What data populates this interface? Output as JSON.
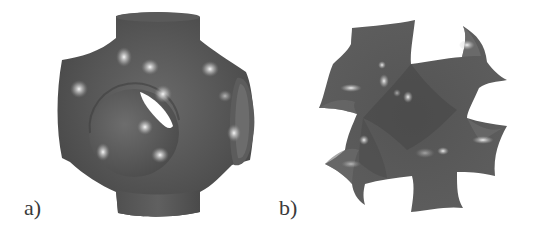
{
  "figure": {
    "panels": [
      {
        "id": "a",
        "label": "a)",
        "subject": "schwarz-p-surface"
      },
      {
        "id": "b",
        "label": "b)",
        "subject": "gyroid-surface"
      }
    ],
    "colors": {
      "background": "#ffffff",
      "surface_dark": "#4a4a4a",
      "surface_mid": "#5e5e5e",
      "highlight": "#f2f2f2",
      "label_text": "#3a3a3a"
    }
  }
}
